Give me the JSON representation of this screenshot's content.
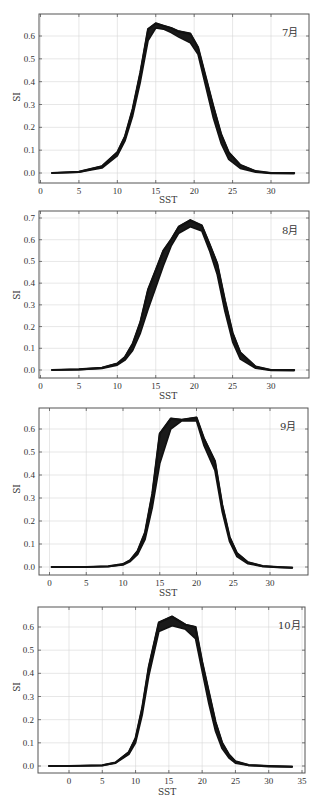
{
  "chart_data": [
    {
      "type": "area",
      "title": "7月",
      "xlabel": "SST",
      "ylabel": "SI",
      "xlim": [
        0,
        34
      ],
      "ylim": [
        -0.03,
        0.69
      ],
      "xticks": [
        0,
        5,
        10,
        15,
        20,
        25,
        30
      ],
      "yticks": [
        0.0,
        0.1,
        0.2,
        0.3,
        0.4,
        0.5,
        0.6
      ],
      "grid": true,
      "series": [
        {
          "name": "upper",
          "x": [
            1.5,
            5,
            8,
            10,
            11,
            12,
            13,
            14,
            15,
            16,
            17,
            18,
            19.5,
            20.5,
            21.5,
            22.5,
            23.5,
            24.5,
            26,
            28,
            30,
            33
          ],
          "values": [
            0.0,
            0.005,
            0.03,
            0.09,
            0.16,
            0.28,
            0.44,
            0.63,
            0.655,
            0.645,
            0.635,
            0.62,
            0.61,
            0.55,
            0.42,
            0.29,
            0.17,
            0.09,
            0.035,
            0.008,
            0.0,
            0.0
          ]
        },
        {
          "name": "lower",
          "x": [
            1.5,
            5,
            8,
            10,
            11,
            12,
            13,
            14,
            15,
            16,
            17,
            18,
            19.5,
            20.5,
            21.5,
            22.5,
            23.5,
            24.5,
            26,
            28,
            30,
            33
          ],
          "values": [
            0.0,
            0.003,
            0.022,
            0.075,
            0.14,
            0.25,
            0.4,
            0.58,
            0.635,
            0.63,
            0.615,
            0.595,
            0.57,
            0.52,
            0.38,
            0.24,
            0.13,
            0.06,
            0.02,
            0.004,
            -0.002,
            -0.003
          ]
        }
      ]
    },
    {
      "type": "area",
      "title": "8月",
      "xlabel": "SST",
      "ylabel": "SI",
      "xlim": [
        0,
        35
      ],
      "ylim": [
        -0.03,
        0.72
      ],
      "xticks": [
        0,
        5,
        10,
        15,
        20,
        25,
        30
      ],
      "yticks": [
        0.0,
        0.1,
        0.2,
        0.3,
        0.4,
        0.5,
        0.6,
        0.7
      ],
      "grid": true,
      "series": [
        {
          "name": "upper",
          "x": [
            1.5,
            5,
            8,
            10,
            11,
            12,
            13,
            14,
            15,
            16,
            17,
            18,
            19.5,
            21,
            22,
            23,
            24,
            25,
            26,
            28,
            30,
            33
          ],
          "values": [
            0.0,
            0.003,
            0.01,
            0.03,
            0.06,
            0.12,
            0.22,
            0.37,
            0.46,
            0.55,
            0.6,
            0.66,
            0.69,
            0.665,
            0.58,
            0.49,
            0.32,
            0.17,
            0.08,
            0.015,
            0.0,
            0.0
          ]
        },
        {
          "name": "lower",
          "x": [
            1.5,
            5,
            8,
            10,
            11,
            12,
            13,
            14,
            15,
            16,
            17,
            18,
            19.5,
            21,
            22,
            23,
            24,
            25,
            26,
            28,
            30,
            33
          ],
          "values": [
            0.0,
            0.002,
            0.007,
            0.022,
            0.045,
            0.09,
            0.17,
            0.28,
            0.38,
            0.48,
            0.57,
            0.63,
            0.66,
            0.64,
            0.55,
            0.44,
            0.27,
            0.13,
            0.05,
            0.008,
            -0.002,
            -0.003
          ]
        }
      ]
    },
    {
      "type": "area",
      "title": "9月",
      "xlabel": "SST",
      "ylabel": "SI",
      "xlim": [
        -1.5,
        35
      ],
      "ylim": [
        -0.03,
        0.69
      ],
      "xticks": [
        0,
        5,
        10,
        15,
        20,
        25,
        30
      ],
      "yticks": [
        0.0,
        0.1,
        0.2,
        0.3,
        0.4,
        0.5,
        0.6
      ],
      "grid": true,
      "series": [
        {
          "name": "upper",
          "x": [
            0.3,
            5,
            8,
            10,
            11,
            12,
            13,
            14,
            15,
            16.5,
            18,
            20,
            21,
            22.5,
            23.5,
            24.5,
            25.5,
            27,
            29,
            31,
            33
          ],
          "values": [
            0.0,
            0.0,
            0.003,
            0.012,
            0.03,
            0.07,
            0.15,
            0.32,
            0.58,
            0.645,
            0.64,
            0.65,
            0.56,
            0.46,
            0.27,
            0.13,
            0.06,
            0.02,
            0.004,
            0.0,
            -0.003
          ]
        },
        {
          "name": "lower",
          "x": [
            0.3,
            5,
            8,
            10,
            11,
            12,
            13,
            14,
            15,
            16.5,
            18,
            20,
            21,
            22.5,
            23.5,
            24.5,
            25.5,
            27,
            29,
            31,
            33
          ],
          "values": [
            0.0,
            0.0,
            0.002,
            0.009,
            0.024,
            0.055,
            0.12,
            0.26,
            0.45,
            0.6,
            0.635,
            0.635,
            0.53,
            0.42,
            0.24,
            0.11,
            0.045,
            0.014,
            0.002,
            -0.002,
            -0.004
          ]
        }
      ]
    },
    {
      "type": "area",
      "title": "10月",
      "xlabel": "SST",
      "ylabel": "SI",
      "xlim": [
        -4.5,
        35.5
      ],
      "ylim": [
        -0.03,
        0.67
      ],
      "xticks": [
        0,
        5,
        10,
        15,
        20,
        25,
        30,
        35
      ],
      "yticks": [
        0.0,
        0.1,
        0.2,
        0.3,
        0.4,
        0.5,
        0.6
      ],
      "grid": true,
      "series": [
        {
          "name": "upper",
          "x": [
            -3,
            0,
            5,
            7,
            9,
            10,
            11,
            12,
            13.5,
            15.5,
            17.5,
            19,
            20,
            21,
            22,
            23,
            24,
            25,
            27,
            30,
            33.5
          ],
          "values": [
            0.0,
            0.0,
            0.003,
            0.015,
            0.06,
            0.12,
            0.25,
            0.43,
            0.62,
            0.645,
            0.61,
            0.6,
            0.45,
            0.32,
            0.19,
            0.1,
            0.05,
            0.02,
            0.004,
            0.0,
            -0.003
          ]
        },
        {
          "name": "lower",
          "x": [
            -3,
            0,
            5,
            7,
            9,
            10,
            11,
            12,
            13.5,
            15.5,
            17.5,
            19,
            20,
            21,
            22,
            23,
            24,
            25,
            27,
            30,
            33.5
          ],
          "values": [
            0.0,
            0.0,
            0.002,
            0.012,
            0.05,
            0.1,
            0.22,
            0.39,
            0.58,
            0.605,
            0.59,
            0.55,
            0.41,
            0.27,
            0.15,
            0.075,
            0.035,
            0.012,
            0.002,
            -0.003,
            -0.004
          ]
        }
      ]
    }
  ],
  "panels": [
    {
      "month": "7月",
      "xlabel": "SST",
      "ylabel": "SI"
    },
    {
      "month": "8月",
      "xlabel": "SST",
      "ylabel": "SI"
    },
    {
      "month": "9月",
      "xlabel": "SST",
      "ylabel": "SI"
    },
    {
      "month": "10月",
      "xlabel": "SST",
      "ylabel": "SI"
    }
  ],
  "colors": {
    "curve": "#111111",
    "grid": "#d6d6d6",
    "frame": "#555555"
  }
}
